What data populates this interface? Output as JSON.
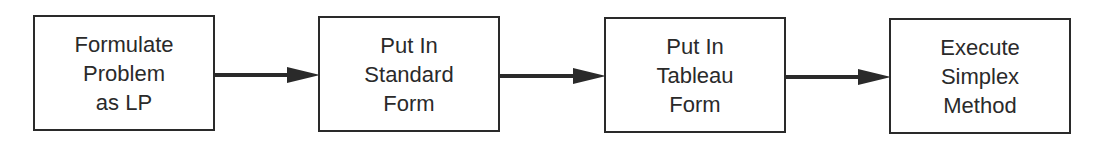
{
  "diagram": {
    "type": "flowchart",
    "direction": "left-to-right",
    "colors": {
      "stroke": "#2a2a2a",
      "fill": "#ffffff",
      "text": "#2a2a2a"
    },
    "steps": [
      {
        "id": "formulate",
        "lines": [
          "Formulate",
          "Problem",
          "as LP"
        ]
      },
      {
        "id": "standard",
        "lines": [
          "Put In",
          "Standard",
          "Form"
        ]
      },
      {
        "id": "tableau",
        "lines": [
          "Put In",
          "Tableau",
          "Form"
        ]
      },
      {
        "id": "simplex",
        "lines": [
          "Execute",
          "Simplex",
          "Method"
        ]
      }
    ],
    "edges": [
      {
        "from": "formulate",
        "to": "standard"
      },
      {
        "from": "standard",
        "to": "tableau"
      },
      {
        "from": "tableau",
        "to": "simplex"
      }
    ]
  }
}
